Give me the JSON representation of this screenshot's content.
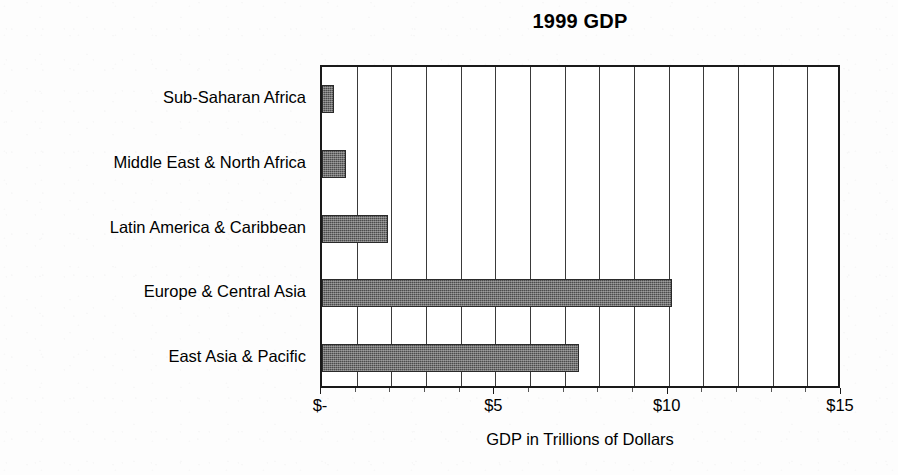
{
  "chart_data": {
    "type": "bar",
    "orientation": "horizontal",
    "title": "1999 GDP",
    "xlabel": "GDP in Trillions of Dollars",
    "ylabel": "",
    "categories": [
      "Sub-Saharan Africa",
      "Middle East & North Africa",
      "Latin America & Caribbean",
      "Europe & Central Asia",
      "East Asia & Pacific"
    ],
    "values": [
      0.35,
      0.7,
      1.9,
      10.1,
      7.4
    ],
    "xlim": [
      0,
      15
    ],
    "xtick_values": [
      0,
      5,
      10,
      15
    ],
    "xtick_labels": [
      "$-",
      "$5",
      "$10",
      "$15"
    ],
    "gridline_values": [
      1,
      2,
      3,
      4,
      5,
      6,
      7,
      8,
      9,
      10,
      11,
      12,
      13,
      14
    ],
    "grid": true,
    "legend": false,
    "bar_color": "#4c4c4c",
    "frame_color": "#1a1a1a",
    "background_color": "#ffffff",
    "units": "trillions of US dollars",
    "series_name": "1999 GDP"
  }
}
